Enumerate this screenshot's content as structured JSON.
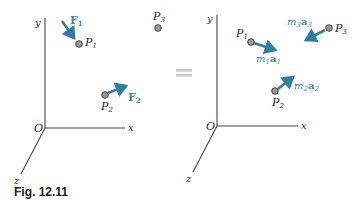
{
  "caption": "Fig. 12.11",
  "colors": {
    "arrow": "#2e7fa6",
    "label_blue": "#3a86b0",
    "axis": "#444444",
    "point_fill": "#9a9a9a",
    "equals": "#c8c8c8"
  },
  "left_panel": {
    "axes": {
      "x": "x",
      "y": "y",
      "z": "z",
      "origin": "O"
    },
    "points": [
      {
        "name": "P",
        "sub": "1"
      },
      {
        "name": "P",
        "sub": "2"
      },
      {
        "name": "P",
        "sub": "3"
      }
    ],
    "forces": [
      {
        "name": "F",
        "sub": "1"
      },
      {
        "name": "F",
        "sub": "2"
      }
    ]
  },
  "equals": "=",
  "right_panel": {
    "axes": {
      "x": "x",
      "y": "y",
      "z": "z",
      "origin": "O"
    },
    "points": [
      {
        "name": "P",
        "sub": "1"
      },
      {
        "name": "P",
        "sub": "2"
      },
      {
        "name": "P",
        "sub": "3"
      }
    ],
    "effective_forces": [
      {
        "m": "m",
        "msub": "1",
        "a": "a",
        "asub": "1"
      },
      {
        "m": "m",
        "msub": "2",
        "a": "a",
        "asub": "2"
      },
      {
        "m": "m",
        "msub": "3",
        "a": "a",
        "asub": "3"
      }
    ]
  }
}
